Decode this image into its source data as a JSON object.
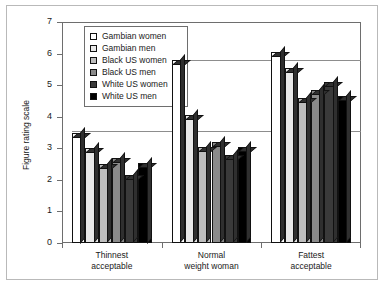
{
  "chart_data": {
    "type": "bar",
    "title": "",
    "xlabel": "",
    "ylabel": "Figure rating scale",
    "ylim": [
      0,
      7
    ],
    "ytick_labels": [
      "0",
      "1",
      "2",
      "3",
      "4",
      "5",
      "6",
      "7"
    ],
    "ytick_values": [
      0,
      1,
      2,
      3,
      4,
      5,
      6,
      7
    ],
    "grid": false,
    "legend_position": "top-left inside plot",
    "categories": [
      "Thinnest acceptable",
      "Normal weight woman",
      "Fattest acceptable"
    ],
    "category_lines": [
      [
        "Thinnest",
        "acceptable"
      ],
      [
        "Normal",
        "weight woman"
      ],
      [
        "Fattest",
        "acceptable"
      ]
    ],
    "series": [
      {
        "name": "Gambian women",
        "color": "#ffffff",
        "values": [
          3.5,
          5.8,
          6.05
        ]
      },
      {
        "name": "Gambian men",
        "color": "#e8e8e8",
        "values": [
          3.0,
          4.05,
          5.55
        ]
      },
      {
        "name": "Black US women",
        "color": "#bdbdbd",
        "values": [
          2.5,
          3.05,
          4.6
        ]
      },
      {
        "name": "Black US men",
        "color": "#8a8a8a",
        "values": [
          2.7,
          3.2,
          4.85
        ]
      },
      {
        "name": "White US women",
        "color": "#3a3a3a",
        "values": [
          2.15,
          2.8,
          5.1
        ]
      },
      {
        "name": "White US men",
        "color": "#000000",
        "values": [
          2.55,
          3.05,
          4.65
        ]
      }
    ],
    "reference_lines": [
      {
        "value": 3.55,
        "label": ""
      },
      {
        "value": 5.8,
        "label": ""
      }
    ]
  }
}
